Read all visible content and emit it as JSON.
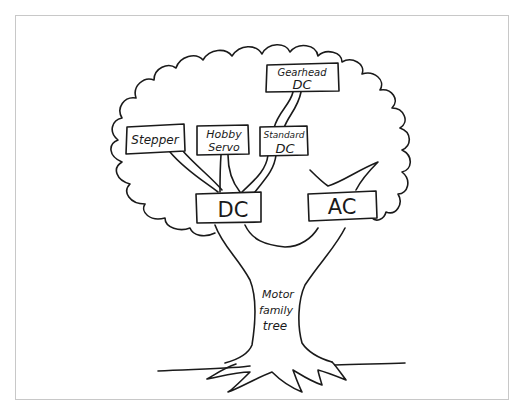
{
  "diagram": {
    "title": "Motor family tree",
    "trunk_label": {
      "line1": "Motor",
      "line2": "family",
      "line3": "tree"
    },
    "nodes": [
      {
        "id": "dc",
        "label": "DC",
        "parent": null
      },
      {
        "id": "ac",
        "label": "AC",
        "parent": null
      },
      {
        "id": "stepper",
        "label": "Stepper",
        "parent": "dc"
      },
      {
        "id": "hobby-servo",
        "label_line1": "Hobby",
        "label_line2": "Servo",
        "parent": "dc"
      },
      {
        "id": "standard-dc",
        "label_line1": "Standard",
        "label_line2": "DC",
        "parent": "dc"
      },
      {
        "id": "gearhead-dc",
        "label_line1": "Gearhead",
        "label_line2": "DC",
        "parent": "standard-dc"
      }
    ],
    "edges": [
      {
        "from": "dc",
        "to": "stepper"
      },
      {
        "from": "dc",
        "to": "hobby-servo"
      },
      {
        "from": "dc",
        "to": "standard-dc"
      },
      {
        "from": "standard-dc",
        "to": "gearhead-dc"
      }
    ],
    "labels": {
      "dc": "DC",
      "ac": "AC",
      "stepper": "Stepper",
      "hobby_line1": "Hobby",
      "hobby_line2": "Servo",
      "standard_line1": "Standard",
      "standard_line2": "DC",
      "gearhead_line1": "Gearhead",
      "gearhead_line2": "DC"
    },
    "colors": {
      "ink": "#1a1a1a",
      "frame": "#c8c8c8",
      "background": "#ffffff"
    }
  }
}
